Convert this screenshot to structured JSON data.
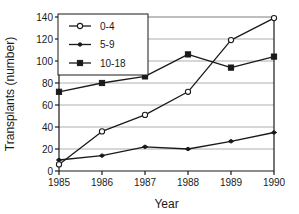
{
  "chart_data": {
    "type": "line",
    "title": "",
    "xlabel": "Year",
    "ylabel": "Transplants (number)",
    "categories": [
      "1985",
      "1986",
      "1987",
      "1988",
      "1989",
      "1990"
    ],
    "x": [
      1985,
      1986,
      1987,
      1988,
      1989,
      1990
    ],
    "xlim": [
      1985,
      1990
    ],
    "ylim": [
      0,
      140
    ],
    "yticks": [
      0,
      20,
      40,
      60,
      80,
      100,
      120,
      140
    ],
    "ytick_labels": [
      "0",
      "20",
      "40",
      "60",
      "80",
      "100",
      "120",
      "140"
    ],
    "xtick_labels": [
      "1985",
      "1986",
      "1987",
      "1988",
      "1989",
      "1990"
    ],
    "grid": "horizontal",
    "legend_position": "top-left",
    "series": [
      {
        "name": "0-4",
        "marker": "open-circle",
        "color": "#1a1a1a",
        "values": [
          6,
          36,
          51,
          72,
          119,
          139
        ]
      },
      {
        "name": "5-9",
        "marker": "small-filled-dot",
        "color": "#1a1a1a",
        "values": [
          10,
          14,
          22,
          20,
          27,
          35
        ]
      },
      {
        "name": "10-18",
        "marker": "filled-square",
        "color": "#1a1a1a",
        "values": [
          72,
          80,
          86,
          106,
          94,
          104
        ]
      }
    ]
  },
  "legend": {
    "items": [
      {
        "label": "0-4"
      },
      {
        "label": "5-9"
      },
      {
        "label": "10-18"
      }
    ]
  },
  "axes": {
    "y_title": "Transplants (number)",
    "x_title": "Year"
  },
  "colors": {
    "axis": "#1a1a1a",
    "grid": "#9a9a9a",
    "series": "#1a1a1a",
    "background": "#ffffff"
  }
}
